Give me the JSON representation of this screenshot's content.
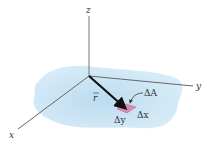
{
  "diagram": {
    "axes": {
      "z_label": "z",
      "y_label": "y",
      "x_label": "x"
    },
    "vector_label": "r",
    "area_element": {
      "label": "ΔA",
      "dx_label": "Δx",
      "dy_label": "Δy"
    },
    "colors": {
      "region_fill": "#cfe6f5",
      "axis": "#666666",
      "vector": "#111111",
      "patch": "#d98cb0"
    }
  }
}
